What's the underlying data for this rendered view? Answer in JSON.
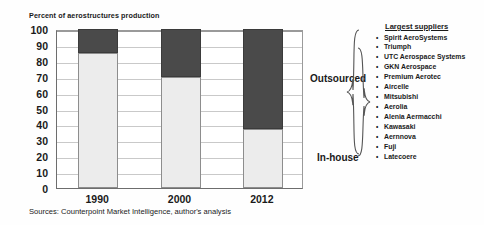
{
  "chart_data": {
    "type": "bar",
    "subtype": "stacked-100-percent",
    "title": "Percent of aerostructures production",
    "xlabel": "",
    "ylabel": "Percent of aerostructures production",
    "categories": [
      "1990",
      "2000",
      "2012"
    ],
    "yticks": [
      0,
      10,
      20,
      30,
      40,
      50,
      60,
      70,
      80,
      90,
      100
    ],
    "ylim": [
      0,
      100
    ],
    "grid": true,
    "legend_position": "right-inline-labels",
    "series": [
      {
        "name": "In-house",
        "values": [
          85,
          70,
          37
        ],
        "color": "#ececec"
      },
      {
        "name": "Outsourced",
        "values": [
          15,
          30,
          63
        ],
        "color": "#4a4a4a"
      }
    ],
    "annotations": [
      "Outsourced",
      "In-house"
    ],
    "source": "Sources: Counterpoint Market Intelligence, author's analysis"
  },
  "labels": {
    "outsourced": "Outsourced",
    "in_house": "In-house"
  },
  "suppliers": {
    "heading": "Largest suppliers",
    "items": [
      "Spirit AeroSystems",
      "Triumph",
      "UTC Aerospace Systems",
      "GKN Aerospace",
      "Premium Aerotec",
      "Aircelle",
      "Mitsubishi",
      "Aerolia",
      "Alenia Aermacchi",
      "Kawasaki",
      "Aernnova",
      "Fuji",
      "Latecoere"
    ]
  },
  "footer": {
    "source": "Sources: Counterpoint Market Intelligence, author's analysis"
  },
  "colors": {
    "outsourced": "#4a4a4a",
    "in_house": "#ececec",
    "axis": "#6d6d6d",
    "grid": "#c9c9c9"
  }
}
